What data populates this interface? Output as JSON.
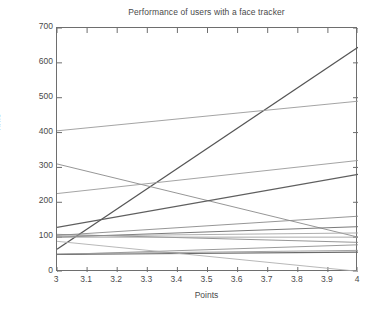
{
  "figure": {
    "background": "#ffffff",
    "axis_color": "#6e6e6e",
    "text_color": "#4a4a4a"
  },
  "chart_data": {
    "type": "line",
    "title": "Performance of users with a face tracker",
    "xlabel": "Points",
    "ylabel": "Time",
    "xlim": [
      3,
      4
    ],
    "ylim": [
      0,
      700
    ],
    "xticks": [
      3,
      3.1,
      3.2,
      3.3,
      3.4,
      3.5,
      3.6,
      3.7,
      3.8,
      3.9,
      4
    ],
    "xticklabels": [
      "3",
      "3.1",
      "3.2",
      "3.3",
      "3.4",
      "3.5",
      "3.6",
      "3.7",
      "3.8",
      "3.9",
      "4"
    ],
    "yticks": [
      0,
      100,
      200,
      300,
      400,
      500,
      600,
      700
    ],
    "yticklabels": [
      "0",
      "100",
      "200",
      "300",
      "400",
      "500",
      "600",
      "700"
    ],
    "grid": false,
    "legend": "none",
    "x": [
      3,
      4
    ],
    "series": [
      {
        "name": "user-1",
        "values": [
          65,
          645
        ],
        "color": "#555555",
        "width": 1.2
      },
      {
        "name": "user-2",
        "values": [
          405,
          490
        ],
        "color": "#9a9a9a",
        "width": 0.9
      },
      {
        "name": "user-3",
        "values": [
          310,
          100
        ],
        "color": "#8a8a8a",
        "width": 0.9
      },
      {
        "name": "user-4",
        "values": [
          225,
          320
        ],
        "color": "#9a9a9a",
        "width": 0.9
      },
      {
        "name": "user-5",
        "values": [
          128,
          280
        ],
        "color": "#5f5f5f",
        "width": 1.2
      },
      {
        "name": "user-6",
        "values": [
          105,
          160
        ],
        "color": "#8a8a8a",
        "width": 0.9
      },
      {
        "name": "user-7",
        "values": [
          100,
          130
        ],
        "color": "#7a7a7a",
        "width": 1.0
      },
      {
        "name": "user-8",
        "values": [
          103,
          112
        ],
        "color": "#a5a5a5",
        "width": 0.9
      },
      {
        "name": "user-9",
        "values": [
          108,
          85
        ],
        "color": "#8a8a8a",
        "width": 0.9
      },
      {
        "name": "user-10",
        "values": [
          50,
          78
        ],
        "color": "#8f8f8f",
        "width": 0.9
      },
      {
        "name": "user-11",
        "values": [
          50,
          57
        ],
        "color": "#6a6a6a",
        "width": 1.1
      },
      {
        "name": "user-12",
        "values": [
          88,
          2
        ],
        "color": "#b0b0b0",
        "width": 0.9
      },
      {
        "name": "user-13",
        "values": [
          52,
          62
        ],
        "color": "#9a9a9a",
        "width": 0.9
      },
      {
        "name": "user-14",
        "values": [
          100,
          100
        ],
        "color": "#9f9f9f",
        "width": 0.9
      }
    ]
  }
}
